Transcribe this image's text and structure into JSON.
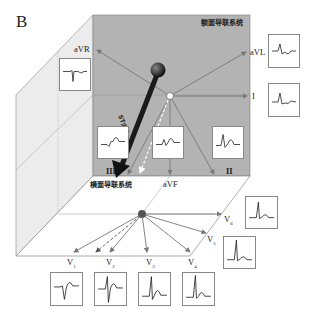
{
  "panel_letter": "B",
  "planes": {
    "frontal": {
      "label": "额面导联系统",
      "color": "#b3b3b3"
    },
    "horizontal": {
      "label": "横面导联系统",
      "color": "#ffffff"
    },
    "side_wall_color": "#e9e9e9"
  },
  "vector": {
    "label": "ST向量",
    "color": "#222222"
  },
  "frontal_leads": [
    {
      "id": "aVR",
      "label": "aVR"
    },
    {
      "id": "aVL",
      "label": "aVL"
    },
    {
      "id": "I",
      "label": "I"
    },
    {
      "id": "II",
      "label": "II"
    },
    {
      "id": "III",
      "label": "III"
    },
    {
      "id": "aVF",
      "label": "aVF"
    }
  ],
  "horizontal_leads": [
    {
      "id": "V1",
      "label": "V",
      "sub": "1"
    },
    {
      "id": "V2",
      "label": "V",
      "sub": "2"
    },
    {
      "id": "V3",
      "label": "V",
      "sub": "3"
    },
    {
      "id": "V4",
      "label": "V",
      "sub": "4"
    },
    {
      "id": "V5",
      "label": "V",
      "sub": "5"
    },
    {
      "id": "V6",
      "label": "V",
      "sub": "6"
    }
  ]
}
